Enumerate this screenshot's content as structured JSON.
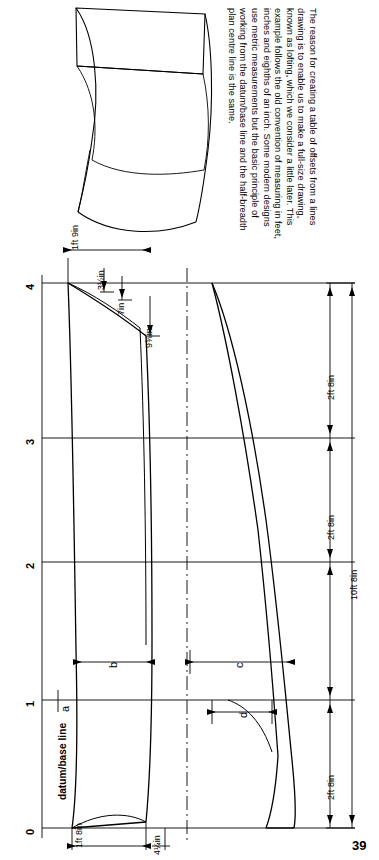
{
  "page": {
    "number": "39",
    "background": "#ffffff",
    "ink": "#000000"
  },
  "caption": {
    "text": "The reason for creating a table of offsets from a lines drawing is to enable us to make a full-size drawing, known as lofting, which we consider a little later. This example follows the old convention of measuring in feet, inches and eighths of an inch. Some modern designs use metric measurements but the basic principle of working from the datum/base line and the half-breadth plan centre line is the same."
  },
  "diagram": {
    "station_labels": [
      "0",
      "1",
      "2",
      "3",
      "4"
    ],
    "baseline_label": "datum/base line",
    "offset_labels": {
      "top_station4_left": "1ft 9in",
      "top_a": "3½in",
      "top_b": "7in",
      "top_c": "9⅝in",
      "bottom_left": "1ft 8in",
      "bottom_right": "4¼in"
    },
    "dimension_labels": {
      "seg_0_1": "2ft 8in",
      "seg_1_2": "2ft 8in",
      "seg_2_3": "2ft 8in",
      "total": "10ft 8in"
    },
    "arrow_labels": [
      "a",
      "b",
      "c",
      "d"
    ]
  }
}
